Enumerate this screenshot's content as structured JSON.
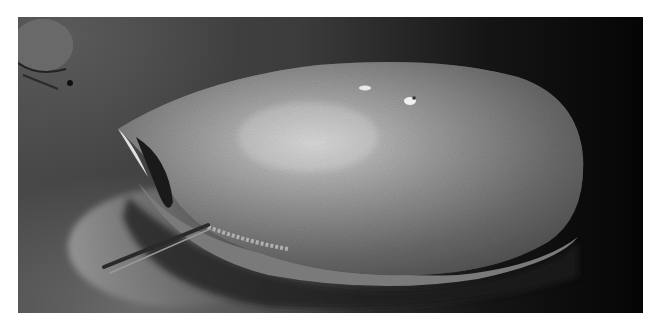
{
  "image": {
    "subject": "horseshoe crab on sand",
    "style": "grayscale photograph",
    "frame": {
      "x": 18,
      "y": 17,
      "width": 625,
      "height": 296
    },
    "colors": {
      "background_dark": "#050505",
      "sand_mid": "#4a4a4a",
      "shell_highlight": "#c8c8c8",
      "shell_mid": "#8a8a8a",
      "shell_shadow": "#3a3a3a"
    }
  }
}
